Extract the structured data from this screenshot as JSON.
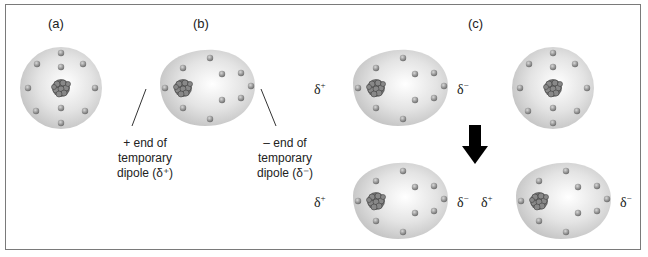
{
  "figure": {
    "panels": [
      {
        "id": "a",
        "label": "(a)",
        "description": "Symmetric atom: nucleus at center, evenly distributed electrons"
      },
      {
        "id": "b",
        "label": "(b)",
        "description": "Atom with temporary dipole: electron cloud distorted, electrons shifted right"
      },
      {
        "id": "c",
        "label": "(c)",
        "description": "Temporary dipole in one atom induces dipole in neighboring atom"
      }
    ],
    "captions": {
      "positive_end": "+ end of\ntemporary\ndipole (δ⁺)",
      "negative_end": "– end of\ntemporary\ndipole (δ⁻)"
    },
    "symbols": {
      "delta_base": "δ",
      "plus": "+",
      "minus": "−"
    },
    "colors": {
      "cloud": "#d6d6d6",
      "electron": "#8a8a8a",
      "nucleus": "#5a5a5a",
      "arrow": "#000000",
      "border": "#7a7a7a"
    }
  }
}
